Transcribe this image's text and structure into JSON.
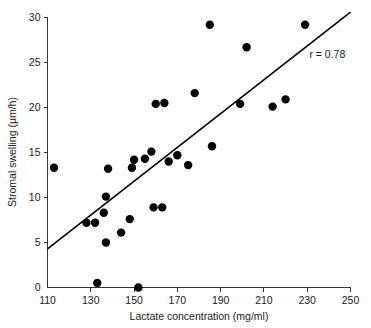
{
  "chart_data": {
    "type": "scatter",
    "title": "",
    "xlabel": "Lactate concentration (mg/ml)",
    "ylabel": "Stromal swelling (μm/h)",
    "xlim": [
      110,
      250
    ],
    "ylim": [
      0,
      30
    ],
    "xticks": [
      110,
      130,
      150,
      170,
      190,
      210,
      230,
      250
    ],
    "yticks": [
      0,
      5,
      10,
      15,
      20,
      25,
      30
    ],
    "xtick_labels": [
      "110",
      "130",
      "150",
      "170",
      "190",
      "210",
      "230",
      "250"
    ],
    "ytick_labels": [
      "0",
      "5",
      "10",
      "15",
      "20",
      "25",
      "30"
    ],
    "grid": false,
    "legend": false,
    "annotations": [
      {
        "name": "correlation-coefficient",
        "text": "r = 0.78",
        "x": 231,
        "y": 25.5
      }
    ],
    "series": [
      {
        "name": "observations",
        "marker": "filled-circle",
        "marker_color": "#000000",
        "marker_size": 4.2,
        "points": [
          {
            "x": 113,
            "y": 13.3
          },
          {
            "x": 128,
            "y": 7.2
          },
          {
            "x": 132,
            "y": 7.2
          },
          {
            "x": 133,
            "y": 0.5
          },
          {
            "x": 136,
            "y": 8.3
          },
          {
            "x": 137,
            "y": 5.0
          },
          {
            "x": 137,
            "y": 10.1
          },
          {
            "x": 138,
            "y": 13.2
          },
          {
            "x": 144,
            "y": 6.1
          },
          {
            "x": 148,
            "y": 7.6
          },
          {
            "x": 149,
            "y": 13.3
          },
          {
            "x": 150,
            "y": 14.2
          },
          {
            "x": 152,
            "y": 0.0
          },
          {
            "x": 155,
            "y": 14.3
          },
          {
            "x": 158,
            "y": 15.1
          },
          {
            "x": 159,
            "y": 8.9
          },
          {
            "x": 160,
            "y": 20.4
          },
          {
            "x": 163,
            "y": 8.9
          },
          {
            "x": 164,
            "y": 20.5
          },
          {
            "x": 166,
            "y": 14.0
          },
          {
            "x": 170,
            "y": 14.7
          },
          {
            "x": 175,
            "y": 13.6
          },
          {
            "x": 178,
            "y": 21.6
          },
          {
            "x": 185,
            "y": 29.2
          },
          {
            "x": 186,
            "y": 15.7
          },
          {
            "x": 199,
            "y": 20.4
          },
          {
            "x": 202,
            "y": 26.7
          },
          {
            "x": 214,
            "y": 20.1
          },
          {
            "x": 220,
            "y": 20.9
          },
          {
            "x": 229,
            "y": 29.2
          }
        ]
      }
    ],
    "fit_line": {
      "name": "regression-line",
      "color": "#000000",
      "x_start": 110,
      "y_start": 4.3,
      "x_end": 250,
      "y_end": 30.6,
      "r": 0.78
    }
  }
}
